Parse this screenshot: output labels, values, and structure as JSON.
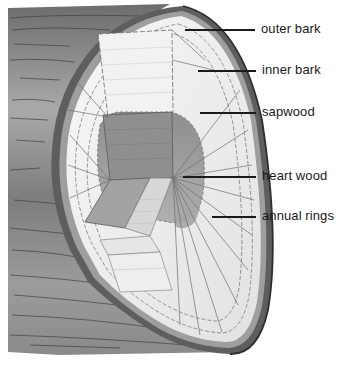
{
  "diagram": {
    "labels": [
      {
        "id": "outer-bark",
        "text": "outer bark"
      },
      {
        "id": "inner-bark",
        "text": "inner bark"
      },
      {
        "id": "sapwood",
        "text": "sapwood"
      },
      {
        "id": "heart-wood",
        "text": "heart wood"
      },
      {
        "id": "annual-rings",
        "text": "annual rings"
      }
    ]
  },
  "colors": {
    "background": "#ffffff",
    "bark_dark": "#4a4a4a",
    "bark_mid": "#8a8a8a",
    "sapwood": "#ececec",
    "heartwood": "#9a9a9a",
    "text": "#1a1a1a"
  }
}
